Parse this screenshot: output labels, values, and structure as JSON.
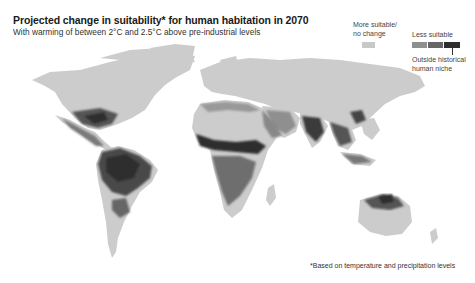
{
  "header": {
    "title": "Projected change in suitability* for human habitation in 2070",
    "subtitle": "With warming of between 2°C and 2.5°C above pre-industrial levels"
  },
  "legend": {
    "more_suitable_label": "More suitable/\nno change",
    "less_suitable_label": "Less suitable",
    "outside_label": "Outside historical\nhuman niche",
    "colors": {
      "more_suitable": "#c8c8c8",
      "less_1": "#8f8f8f",
      "less_2": "#666666",
      "outside": "#2e2e2e"
    }
  },
  "footnote": "*Based on temperature and precipitation levels",
  "map": {
    "land_color": "#cccccc",
    "background": "#ffffff",
    "regions_less_suitable": [
      "Southern United States",
      "Mexico",
      "Central America",
      "Amazon / northern South America",
      "Sahel / West Africa",
      "Central Africa",
      "Middle East / Arabian Peninsula",
      "India",
      "Southeast Asia",
      "Northern Australia"
    ]
  }
}
